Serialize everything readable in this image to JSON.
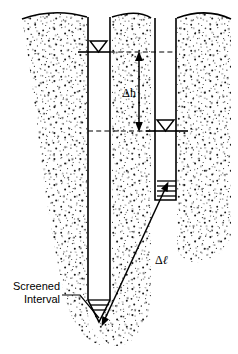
{
  "figure": {
    "background_color": "#ffffff",
    "ink_color": "#000000",
    "width": 238,
    "height": 354
  },
  "labels": {
    "head_difference": "Δh",
    "flow_length": "Δℓ",
    "flow_length_delta": "Δ",
    "flow_length_ell": "ℓ",
    "screened_interval_line1": "Screened",
    "screened_interval_line2": "Interval"
  },
  "annotations": {
    "water_table_symbol": "inverted-open-triangle",
    "left_well_water_level_symbol": "▽",
    "right_well_water_level_symbol": "▽",
    "upper_potentiometric_line_style": "dashed",
    "lower_potentiometric_line_style": "dashed",
    "head_difference_arrow_style": "double-headed-vertical",
    "flow_length_arrow_style": "double-headed-diagonal",
    "screen_hatch_count": 3
  },
  "components": {
    "ground_surface": "wavy ground surface line",
    "soil_body": "stippled unconsolidated deposit, tapering to a rounded bottom",
    "left_well": "deep monitoring well casing",
    "right_well": "shallow monitoring well casing",
    "left_well_screen": "screened interval at base of deep well",
    "right_well_screen": "screened interval at base of shallow well"
  }
}
